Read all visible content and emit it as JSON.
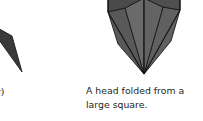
{
  "page": {
    "background_color": "#ffffff",
    "width": 203,
    "height": 121
  },
  "caption": {
    "line1": "A head folded from a",
    "line2": "large square.",
    "full_text": "A head folded from a large square.",
    "color": "#231f20"
  },
  "cropped_label": {
    "text": "r)",
    "note": "cut-off text fragment at left edge"
  },
  "figures": [
    {
      "name": "folded-head-figure",
      "description": "A head folded from a large square",
      "fill_front": "#636363",
      "fill_side_left": "#595959",
      "fill_side_right": "#606060",
      "fill_top_flap_left": "#4a4a4a",
      "fill_top_flap_right": "#4f4f4f",
      "stroke": "#1a1a1a"
    },
    {
      "name": "partial-triangle-figure",
      "description": "dark triangular flap cropped at left edge",
      "fill": "#3a3a3a",
      "stroke": "#1a1a1a"
    }
  ]
}
